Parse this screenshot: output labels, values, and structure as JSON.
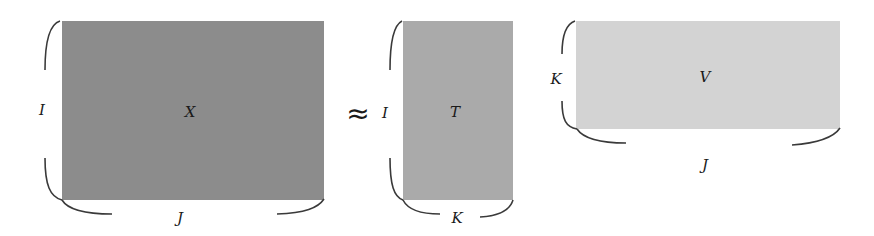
{
  "diagram": {
    "type": "matrix-factorization",
    "relation_symbol": "≈",
    "colors": {
      "X": "#8c8c8c",
      "T": "#aaaaaa",
      "V": "#d3d3d3",
      "brace": "#3a3a3a"
    },
    "matrices": [
      {
        "name": "X",
        "rows_label": "I",
        "cols_label": "J"
      },
      {
        "name": "T",
        "rows_label": "I",
        "cols_label": "K"
      },
      {
        "name": "V",
        "rows_label": "K",
        "cols_label": "J"
      }
    ]
  }
}
